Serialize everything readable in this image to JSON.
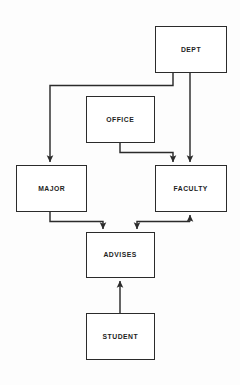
{
  "diagram": {
    "type": "entity-relationship-flow-diagram",
    "background_color": "#fdfdfd",
    "stroke_color": "#2b2b2b",
    "text_color": "#1d1d1d",
    "nodes": [
      {
        "id": "dept",
        "label": "DEPT",
        "x": 155,
        "y": 26,
        "w": 72,
        "h": 47
      },
      {
        "id": "office",
        "label": "OFFICE",
        "x": 86,
        "y": 96,
        "w": 69,
        "h": 47
      },
      {
        "id": "major",
        "label": "MAJOR",
        "x": 16,
        "y": 165,
        "w": 71,
        "h": 47
      },
      {
        "id": "faculty",
        "label": "FACULTY",
        "x": 155,
        "y": 165,
        "w": 72,
        "h": 47
      },
      {
        "id": "advises",
        "label": "ADVISES",
        "x": 86,
        "y": 232,
        "w": 69,
        "h": 46
      },
      {
        "id": "student",
        "label": "STUDENT",
        "x": 86,
        "y": 313,
        "w": 69,
        "h": 47
      }
    ],
    "edges": [
      {
        "id": "dept-to-major",
        "from": "dept",
        "to": "major",
        "path": "M 173 73 L 173 85 L 50 85 L 50 163",
        "arrow_at": "major-top"
      },
      {
        "id": "dept-to-faculty",
        "from": "dept",
        "to": "faculty",
        "path": "M 190 73 L 190 163",
        "arrow_at": "faculty-top"
      },
      {
        "id": "office-to-faculty",
        "from": "office",
        "to": "faculty",
        "path": "M 120 143 L 120 152 L 173 152 L 173 163",
        "arrow_at": "faculty-top"
      },
      {
        "id": "major-to-advises",
        "from": "major",
        "to": "advises",
        "path": "M 50 212 L 50 221 L 103 221 L 103 230",
        "arrow_at": "advises-top"
      },
      {
        "id": "faculty-to-advises",
        "from": "faculty",
        "to": "advises",
        "path": "M 190 214 L 190 221 L 137 221 L 137 230",
        "arrow_at": "advises-top"
      },
      {
        "id": "advises-to-faculty",
        "from": "advises",
        "to": "faculty",
        "path": "M 190 221 L 190 214",
        "arrow_at": "faculty-bottom"
      },
      {
        "id": "student-to-advises",
        "from": "student",
        "to": "advises",
        "path": "M 120 313 L 120 280",
        "arrow_at": "advises-bottom"
      }
    ]
  }
}
